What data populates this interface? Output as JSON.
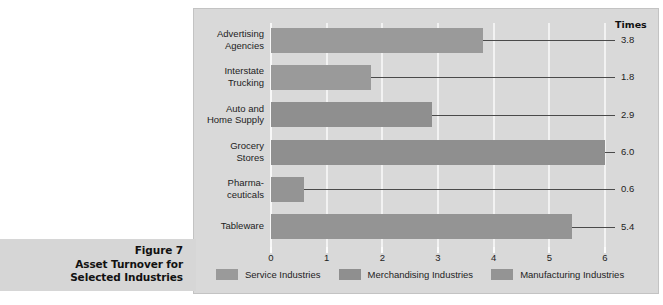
{
  "caption": {
    "line1": "Figure 7",
    "line2": "Asset Turnover for",
    "line3": "Selected Industries"
  },
  "chart": {
    "times_header": "Times"
  },
  "chart_data": {
    "type": "bar",
    "orientation": "horizontal",
    "title": "Asset Turnover for Selected Industries",
    "subtitle": "Figure 7",
    "xlabel": "",
    "ylabel": "",
    "value_axis_label": "Times",
    "xlim": [
      0,
      6
    ],
    "grid": true,
    "legend_position": "bottom",
    "categories": [
      "Advertising Agencies",
      "Interstate Trucking",
      "Auto and Home Supply",
      "Grocery Stores",
      "Pharmaceuticals",
      "Tableware"
    ],
    "category_label_lines": [
      [
        "Advertising",
        "Agencies"
      ],
      [
        "Interstate",
        "Trucking"
      ],
      [
        "Auto and",
        "Home Supply"
      ],
      [
        "Grocery",
        "Stores"
      ],
      [
        "Pharma-",
        "ceuticals"
      ],
      [
        "Tableware"
      ]
    ],
    "values": [
      3.8,
      1.8,
      2.9,
      6.0,
      0.6,
      5.4
    ],
    "value_labels": [
      "3.8",
      "1.8",
      "2.9",
      "6.0",
      "0.6",
      "5.4"
    ],
    "groups": [
      "Service Industries",
      "Service Industries",
      "Merchandising Industries",
      "Merchandising Industries",
      "Manufacturing Industries",
      "Manufacturing Industries"
    ],
    "tick_labels": [
      "0",
      "1",
      "2",
      "3",
      "4",
      "5",
      "6"
    ],
    "tick_values": [
      0,
      1,
      2,
      3,
      4,
      5,
      6
    ],
    "legend": [
      {
        "label": "Service Industries",
        "color": "#9a9a9a"
      },
      {
        "label": "Merchandising Industries",
        "color": "#8f8f8f"
      },
      {
        "label": "Manufacturing Industries",
        "color": "#949494"
      }
    ],
    "colors": {
      "panel_background": "#d9d9d9",
      "caption_background": "#d6d6d6",
      "bar_service": "#9a9a9a",
      "bar_merchandising": "#8f8f8f",
      "bar_manufacturing": "#949494",
      "gridline": "#f2f2f2",
      "leader_line": "#4a4a4a",
      "text": "#1d1d1d"
    }
  }
}
